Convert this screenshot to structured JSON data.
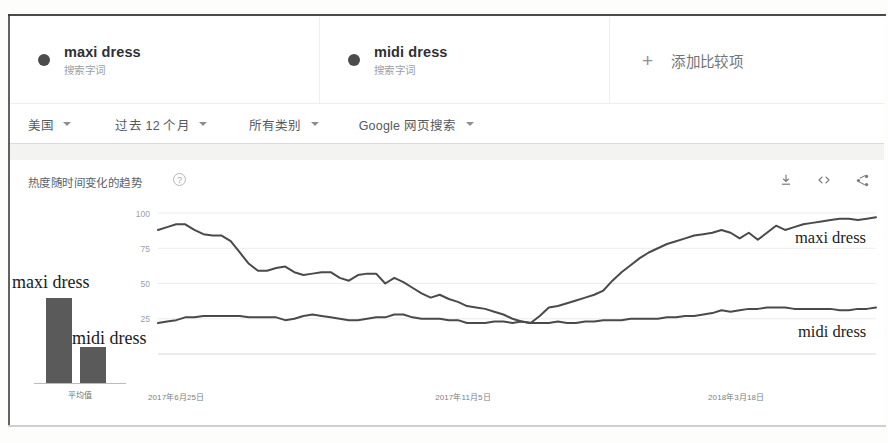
{
  "header": {
    "terms": [
      {
        "title": "maxi dress",
        "subtitle": "搜索字词",
        "color": "#4c4c4c",
        "dot_name": "series-dot-maxi"
      },
      {
        "title": "midi dress",
        "subtitle": "搜索字词",
        "color": "#4c4c4c",
        "dot_name": "series-dot-midi"
      }
    ],
    "add_comparison": {
      "plus": "+",
      "label": "添加比较项"
    }
  },
  "filters": [
    {
      "label": "美国",
      "name": "filter-region"
    },
    {
      "label": "过去 12 个月",
      "name": "filter-time-range"
    },
    {
      "label": "所有类别",
      "name": "filter-category"
    },
    {
      "label": "Google 网页搜索",
      "name": "filter-search-type"
    }
  ],
  "panel": {
    "title": "热度随时间变化的趋势",
    "help": "?",
    "tools": [
      {
        "name": "download-icon",
        "title": "下载"
      },
      {
        "name": "embed-code-icon",
        "title": "嵌入代码"
      },
      {
        "name": "share-icon",
        "title": "分享"
      }
    ]
  },
  "annotations": {
    "left_maxi": "maxi dress",
    "left_midi": "midi dress",
    "right_maxi": "maxi dress",
    "right_midi": "midi dress",
    "bar_caption": "平均值",
    "bar_values": [
      88,
      27
    ]
  },
  "chart_data": {
    "type": "line",
    "title": "热度随时间变化的趋势",
    "xlabel": "",
    "ylabel": "",
    "ylim": [
      0,
      100
    ],
    "yticks": [
      25,
      50,
      75,
      100
    ],
    "ytick_labels": [
      "25",
      "50",
      "75",
      "100"
    ],
    "grid": true,
    "legend": "inline-right",
    "xtick_labels": [
      "2017年6月25日",
      "2017年11月5日",
      "2018年3月18日"
    ],
    "xtick_positions": [
      0,
      0.4,
      0.78
    ],
    "series": [
      {
        "name": "maxi dress",
        "color": "#4a4a4a",
        "values": [
          88,
          90,
          92,
          92,
          88,
          85,
          84,
          84,
          80,
          72,
          64,
          59,
          59,
          61,
          62,
          58,
          56,
          57,
          58,
          58,
          54,
          52,
          56,
          57,
          57,
          50,
          54,
          51,
          47,
          43,
          40,
          42,
          39,
          37,
          34,
          33,
          32,
          30,
          28,
          25,
          23,
          22,
          27,
          33,
          34,
          36,
          38,
          40,
          42,
          45,
          52,
          58,
          63,
          68,
          72,
          75,
          78,
          80,
          82,
          84,
          85,
          86,
          88,
          86,
          82,
          86,
          81,
          86,
          91,
          88,
          90,
          92,
          93,
          94,
          95,
          96,
          96,
          95,
          96,
          97
        ]
      },
      {
        "name": "midi dress",
        "color": "#4a4a4a",
        "values": [
          22,
          23,
          24,
          26,
          26,
          27,
          27,
          27,
          27,
          27,
          26,
          26,
          26,
          26,
          24,
          25,
          27,
          28,
          27,
          26,
          25,
          24,
          24,
          25,
          26,
          26,
          28,
          28,
          26,
          25,
          25,
          25,
          24,
          24,
          22,
          22,
          22,
          23,
          23,
          22,
          23,
          22,
          22,
          22,
          23,
          22,
          22,
          23,
          23,
          24,
          24,
          24,
          25,
          25,
          25,
          25,
          26,
          26,
          27,
          27,
          28,
          29,
          31,
          30,
          31,
          32,
          32,
          33,
          33,
          33,
          32,
          32,
          32,
          32,
          32,
          31,
          31,
          32,
          32,
          33
        ]
      }
    ],
    "bar_overlay": {
      "type": "bar",
      "caption": "平均值",
      "categories": [
        "maxi dress",
        "midi dress"
      ],
      "values": [
        88,
        27
      ],
      "ylim": [
        0,
        100
      ]
    }
  }
}
